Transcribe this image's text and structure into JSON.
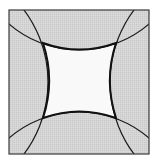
{
  "figure": {
    "colors": {
      "background": "#ffffff",
      "shaded_fill": "#d2d2d2",
      "inner_fill": "#f9f9f9",
      "stroke": "#1a1a1a",
      "border": "#3a3a3a"
    },
    "square": {
      "x": 9,
      "y": 10,
      "width": 140,
      "height": 144
    },
    "arcs": [
      {
        "name": "left-arc",
        "cx": -72,
        "cy": 82,
        "r": 120
      },
      {
        "name": "right-arc",
        "cx": 230,
        "cy": 82,
        "r": 120
      },
      {
        "name": "top-arc",
        "cx": 79,
        "cy": -57,
        "r": 107
      },
      {
        "name": "bottom-arc",
        "cx": 79,
        "cy": 219,
        "r": 107
      }
    ],
    "intersections": [
      {
        "x": 43,
        "y": 43
      },
      {
        "x": 116,
        "y": 43
      },
      {
        "x": 43,
        "y": 118
      },
      {
        "x": 116,
        "y": 118
      }
    ]
  }
}
